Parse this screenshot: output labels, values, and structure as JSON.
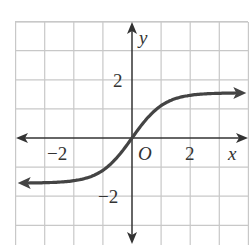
{
  "caption_partial": "g(x)",
  "chart_data": {
    "type": "line",
    "title": "",
    "xlabel": "x",
    "ylabel": "y",
    "origin_label": "O",
    "xlim": [
      -4,
      4
    ],
    "ylim": [
      -4,
      4
    ],
    "grid": true,
    "x_tick_labels": [
      {
        "value": -2,
        "label": "−2"
      },
      {
        "value": 2,
        "label": "2"
      }
    ],
    "y_tick_labels": [
      {
        "value": 2,
        "label": "2"
      },
      {
        "value": -2,
        "label": "−2"
      }
    ],
    "series": [
      {
        "name": "g(x)",
        "description": "S-shaped increasing curve through origin, horizontal asymptotes near y=1.5 and y=-1.5, arrows on both ends",
        "x": [
          -3.8,
          -3,
          -2,
          -1,
          -0.5,
          0,
          0.5,
          1,
          2,
          3,
          3.8
        ],
        "y": [
          -1.5,
          -1.45,
          -1.35,
          -1.0,
          -0.6,
          0,
          0.6,
          1.0,
          1.35,
          1.45,
          1.5
        ]
      }
    ],
    "colors": {
      "grid": "#c8c8c8",
      "axes": "#333333",
      "curve": "#444444"
    }
  }
}
